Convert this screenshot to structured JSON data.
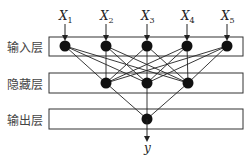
{
  "diagram": {
    "type": "neural-network",
    "layers": [
      {
        "name": "输入层",
        "nodes": 5
      },
      {
        "name": "隐藏层",
        "nodes": 3
      },
      {
        "name": "输出层",
        "nodes": 1
      }
    ],
    "inputs": [
      {
        "label": "X",
        "sub": "1"
      },
      {
        "label": "X",
        "sub": "2"
      },
      {
        "label": "X",
        "sub": "3"
      },
      {
        "label": "X",
        "sub": "4"
      },
      {
        "label": "X",
        "sub": "5"
      }
    ],
    "output_label": "y",
    "colors": {
      "line": "#222222",
      "node": "#111111",
      "box": "#333333",
      "label": "#444444"
    }
  }
}
